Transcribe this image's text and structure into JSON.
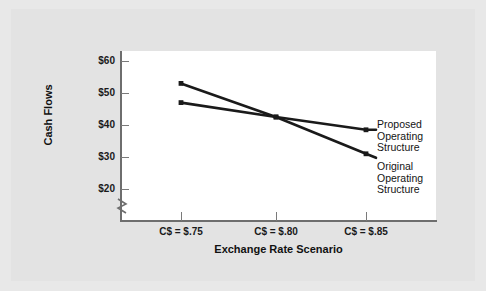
{
  "chart_data": {
    "type": "line",
    "title": "",
    "subtitle": "",
    "xlabel": "Exchange Rate Scenario",
    "ylabel": "Cash Flows",
    "categories": [
      "C$ = $.75",
      "C$ = $.80",
      "C$ = $.85"
    ],
    "x": [
      0.75,
      0.8,
      0.85
    ],
    "yticks": [
      "$60",
      "$50",
      "$40",
      "$30",
      "$20"
    ],
    "ytick_values": [
      60,
      50,
      40,
      30,
      20
    ],
    "ylim": [
      20,
      62
    ],
    "axis_break": true,
    "grid": false,
    "legend_position": "right-inline",
    "series": [
      {
        "name": "Original Operating Structure",
        "values": [
          53,
          42.5,
          31
        ],
        "color": "#1a1a1a",
        "marker": "square"
      },
      {
        "name": "Proposed Operating Structure",
        "values": [
          47,
          42.5,
          38.5
        ],
        "color": "#1a1a1a",
        "marker": "square"
      }
    ],
    "annotations": [
      {
        "text": "Proposed Operating Structure",
        "lines": [
          "Proposed",
          "Operating",
          "Structure"
        ]
      },
      {
        "text": "Original Operating Structure",
        "lines": [
          "Original",
          "Operating",
          "Structure"
        ]
      }
    ]
  },
  "axis": {
    "y_title": "Cash Flows",
    "x_title": "Exchange Rate Scenario",
    "y_labels": [
      "$60",
      "$50",
      "$40",
      "$30",
      "$20"
    ],
    "x_labels": [
      "C$ = $.75",
      "C$ = $.80",
      "C$ = $.85"
    ]
  },
  "annotations": {
    "proposed": {
      "line1": "Proposed",
      "line2": "Operating",
      "line3": "Structure"
    },
    "original": {
      "line1": "Original",
      "line2": "Operating",
      "line3": "Structure"
    }
  },
  "colors": {
    "background": "#e8e8e8",
    "panel": "#e3e3e3",
    "plot": "#ffffff",
    "series": "#1a1a1a",
    "axis": "#6e6e6e"
  }
}
